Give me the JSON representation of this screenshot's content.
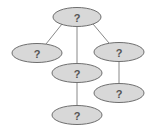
{
  "diagram": {
    "type": "tree",
    "nodes": [
      {
        "id": "root",
        "label": "?",
        "cx": 77,
        "cy": 17,
        "rx": 24,
        "ry": 9.5
      },
      {
        "id": "left",
        "label": "?",
        "cx": 37,
        "cy": 53,
        "rx": 25,
        "ry": 9.5
      },
      {
        "id": "middle",
        "label": "?",
        "cx": 77,
        "cy": 73,
        "rx": 25,
        "ry": 9.5
      },
      {
        "id": "right",
        "label": "?",
        "cx": 119,
        "cy": 52,
        "rx": 25,
        "ry": 9.5
      },
      {
        "id": "middle-child",
        "label": "?",
        "cx": 77,
        "cy": 115,
        "rx": 25,
        "ry": 9.5
      },
      {
        "id": "right-child",
        "label": "?",
        "cx": 119,
        "cy": 93,
        "rx": 25,
        "ry": 9.5
      }
    ],
    "edges": [
      {
        "from": "root",
        "to": "left",
        "x1": 62,
        "y1": 24,
        "x2": 46,
        "y2": 44
      },
      {
        "from": "root",
        "to": "middle",
        "x1": 77,
        "y1": 26.5,
        "x2": 77,
        "y2": 63.5
      },
      {
        "from": "root",
        "to": "right",
        "x1": 93,
        "y1": 24,
        "x2": 109,
        "y2": 43
      },
      {
        "from": "middle",
        "to": "middle-child",
        "x1": 77,
        "y1": 82.5,
        "x2": 77,
        "y2": 105.5
      },
      {
        "from": "right",
        "to": "right-child",
        "x1": 119,
        "y1": 61.5,
        "x2": 119,
        "y2": 83.5
      }
    ],
    "colors": {
      "node_fill": "#d8d8d8",
      "node_stroke": "#6e6e6e",
      "label": "#555555",
      "edge": "#7a7a7a"
    }
  }
}
